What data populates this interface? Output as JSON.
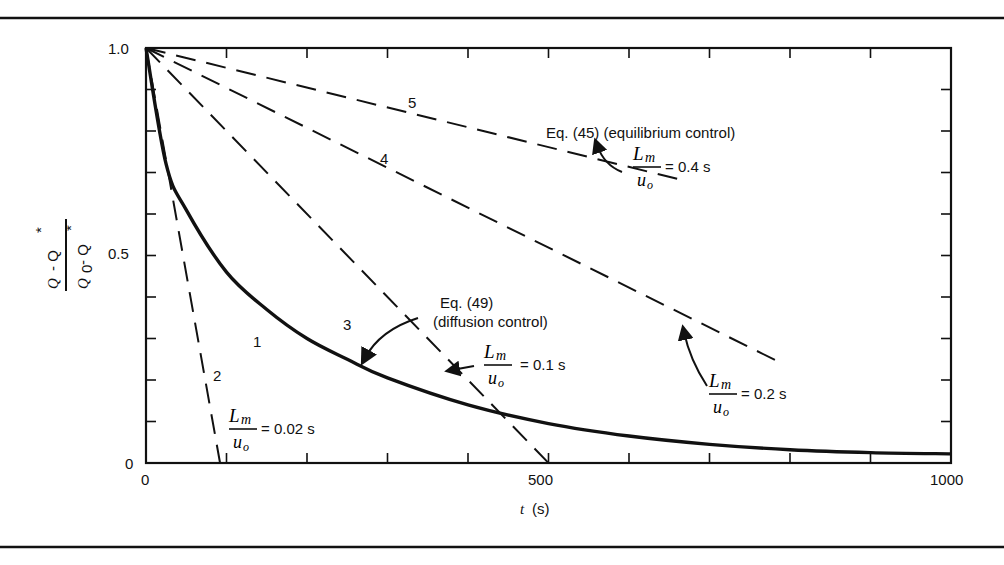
{
  "chart_data": {
    "type": "line",
    "title": "",
    "xlabel": "t (s)",
    "ylabel": "(Q - Q*)/(Q0 - Q*)",
    "xlim": [
      0,
      1000
    ],
    "ylim": [
      0,
      1.0
    ],
    "x_ticks": [
      0,
      500,
      1000
    ],
    "y_ticks": [
      0,
      0.5,
      1.0
    ],
    "grid": false,
    "series": [
      {
        "name": "1",
        "style": "solid",
        "label": "Eq. (49) (diffusion control)",
        "x": [
          0,
          25,
          50,
          100,
          150,
          200,
          250,
          300,
          400,
          500,
          600,
          700,
          800,
          900,
          1000
        ],
        "y": [
          1.0,
          0.72,
          0.61,
          0.46,
          0.37,
          0.3,
          0.25,
          0.205,
          0.14,
          0.095,
          0.065,
          0.045,
          0.032,
          0.025,
          0.022
        ]
      },
      {
        "name": "2",
        "style": "dashed",
        "label": "Lm/uo = 0.02 s",
        "x": [
          0,
          92
        ],
        "y": [
          1.0,
          0.0
        ]
      },
      {
        "name": "3",
        "style": "dashed",
        "label": "Lm/uo = 0.1 s",
        "x": [
          0,
          500
        ],
        "y": [
          1.0,
          0.0
        ]
      },
      {
        "name": "4",
        "style": "dashed",
        "label": "Lm/uo = 0.2 s",
        "x": [
          0,
          790
        ],
        "y": [
          1.0,
          0.24
        ]
      },
      {
        "name": "5",
        "style": "dashed",
        "label": "Lm/uo = 0.4 s; Eq. (45) (equilibrium control)",
        "x": [
          0,
          670
        ],
        "y": [
          1.0,
          0.68
        ]
      }
    ],
    "annotations": [
      "Eq. (45) (equilibrium control)",
      "Eq. (49)",
      "(diffusion control)",
      "Lm/uo = 0.4 s",
      "Lm/uo = 0.2 s",
      "Lm/uo = 0.1 s",
      "Lm/uo = 0.02 s"
    ]
  },
  "labels": {
    "y_top": "1.0",
    "y_mid": "0.5",
    "y_zero": "0",
    "x_zero": "0",
    "x_mid": "500",
    "x_max": "1000",
    "x_axis_t": "t",
    "x_axis_unit": "(s)",
    "curve1": "1",
    "curve2": "2",
    "curve3": "3",
    "curve4": "4",
    "curve5": "5",
    "eq45": "Eq. (45) (equilibrium control)",
    "eq49_a": "Eq. (49)",
    "eq49_b": "(diffusion control)",
    "lm": "L",
    "lm_sub": "m",
    "uo": "u",
    "uo_sub": "o",
    "val_04": "= 0.4 s",
    "val_02": "= 0.2 s",
    "val_01": "= 0.1 s",
    "val_002": "= 0.02 s",
    "ylab_num_a": "Q",
    "ylab_num_b": "- Q",
    "ylab_den_a": "Q",
    "ylab_den_sub": "0",
    "ylab_den_b": "- Q",
    "star": "*"
  }
}
